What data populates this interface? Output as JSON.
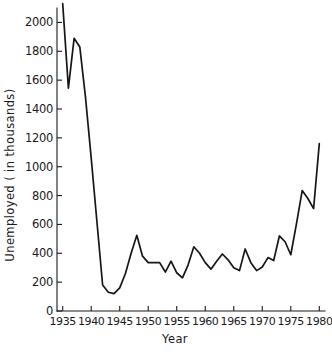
{
  "chart_data": {
    "type": "line",
    "title": "",
    "xlabel": "Year",
    "ylabel": "Unemployed ( in thousands)",
    "xlim": [
      1934,
      1981
    ],
    "ylim": [
      0,
      2100
    ],
    "grid": false,
    "legend": null,
    "xticks": [
      1935,
      1940,
      1945,
      1950,
      1955,
      1960,
      1965,
      1970,
      1975,
      1980
    ],
    "xtick_labels": [
      "1935",
      "1940",
      "1945",
      "1950",
      "1955",
      "1960",
      "1965",
      "1970",
      "1975",
      "1980"
    ],
    "yticks": [
      0,
      200,
      400,
      600,
      800,
      1000,
      1200,
      1400,
      1600,
      1800,
      2000
    ],
    "ytick_labels": [
      "0",
      "200",
      "400",
      "600",
      "800",
      "1000",
      "1200",
      "1400",
      "1600",
      "1800",
      "2000"
    ],
    "x": [
      1935,
      1936,
      1937,
      1938,
      1939,
      1940,
      1941,
      1942,
      1943,
      1944,
      1945,
      1946,
      1947,
      1948,
      1949,
      1950,
      1951,
      1952,
      1953,
      1954,
      1955,
      1956,
      1957,
      1958,
      1959,
      1960,
      1961,
      1962,
      1963,
      1964,
      1965,
      1966,
      1967,
      1968,
      1969,
      1970,
      1971,
      1972,
      1973,
      1974,
      1975,
      1976,
      1977,
      1978,
      1979,
      1980
    ],
    "values": [
      2130,
      1545,
      1890,
      1830,
      1480,
      1060,
      620,
      180,
      130,
      120,
      160,
      260,
      400,
      525,
      380,
      335,
      335,
      335,
      270,
      345,
      265,
      230,
      320,
      445,
      400,
      335,
      290,
      345,
      395,
      355,
      300,
      280,
      430,
      335,
      280,
      305,
      370,
      350,
      520,
      480,
      390,
      605,
      835,
      780,
      710,
      1160
    ]
  },
  "axis": {
    "y_title": "Unemployed ( in thousands)",
    "x_title": "Year"
  }
}
